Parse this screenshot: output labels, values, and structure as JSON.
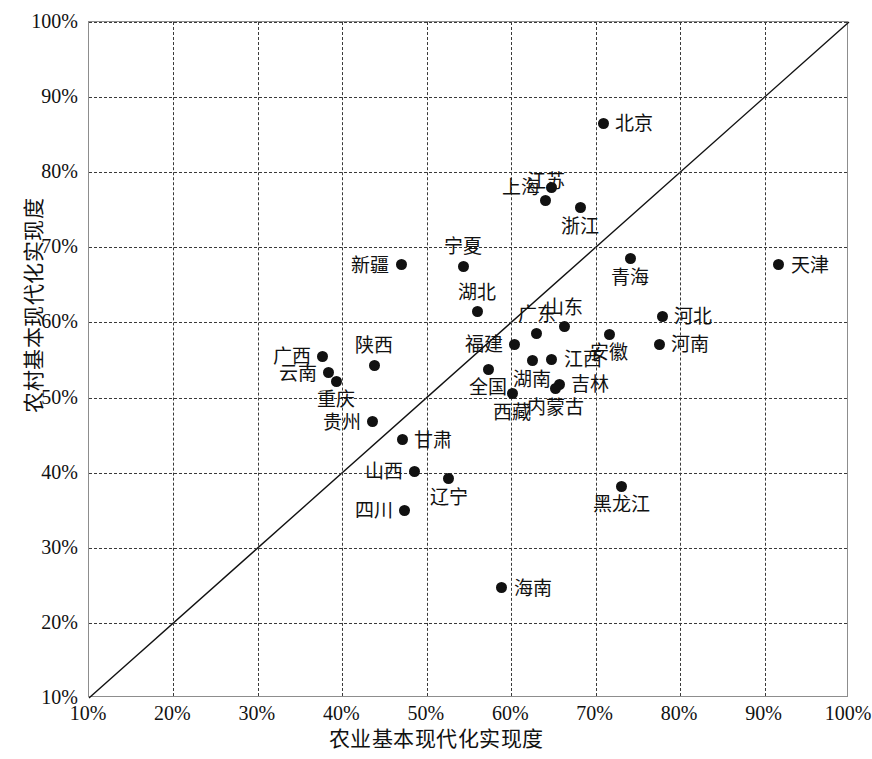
{
  "chart_data": {
    "type": "scatter",
    "title": "",
    "xlabel": "农业基本现代化实现度",
    "ylabel": "农村基本现代化实现度",
    "xlim": [
      10,
      100
    ],
    "ylim": [
      10,
      100
    ],
    "xticks": [
      "10%",
      "20%",
      "30%",
      "40%",
      "50%",
      "60%",
      "70%",
      "80%",
      "90%",
      "100%"
    ],
    "yticks": [
      "10%",
      "20%",
      "30%",
      "40%",
      "50%",
      "60%",
      "70%",
      "80%",
      "90%",
      "100%"
    ],
    "grid": true,
    "legend": "none",
    "reference_line": {
      "type": "identity",
      "from": [
        10,
        10
      ],
      "to": [
        100,
        100
      ]
    },
    "marker_color": "#111111",
    "grid_color": "#3a3a3a",
    "points": [
      {
        "label": "北京",
        "x": 70.9,
        "y": 86.5,
        "pos": "right"
      },
      {
        "label": "江苏",
        "x": 64.1,
        "y": 76.2,
        "pos": "above"
      },
      {
        "label": "上海",
        "x": 64.8,
        "y": 78.0,
        "pos": "left"
      },
      {
        "label": "浙江",
        "x": 68.2,
        "y": 75.3,
        "pos": "below"
      },
      {
        "label": "天津",
        "x": 91.7,
        "y": 67.7,
        "pos": "right"
      },
      {
        "label": "青海",
        "x": 74.1,
        "y": 68.5,
        "pos": "below"
      },
      {
        "label": "宁夏",
        "x": 54.3,
        "y": 67.5,
        "pos": "above"
      },
      {
        "label": "新疆",
        "x": 47.0,
        "y": 67.7,
        "pos": "left"
      },
      {
        "label": "湖北",
        "x": 56.0,
        "y": 61.4,
        "pos": "above"
      },
      {
        "label": "河北",
        "x": 77.9,
        "y": 60.8,
        "pos": "right"
      },
      {
        "label": "山东",
        "x": 66.3,
        "y": 59.4,
        "pos": "above"
      },
      {
        "label": "广东",
        "x": 63.0,
        "y": 58.5,
        "pos": "above"
      },
      {
        "label": "安徽",
        "x": 71.6,
        "y": 58.4,
        "pos": "below"
      },
      {
        "label": "河南",
        "x": 77.5,
        "y": 57.1,
        "pos": "right"
      },
      {
        "label": "福建",
        "x": 60.4,
        "y": 57.1,
        "pos": "left"
      },
      {
        "label": "广西",
        "x": 37.7,
        "y": 55.5,
        "pos": "left"
      },
      {
        "label": "陕西",
        "x": 43.8,
        "y": 54.3,
        "pos": "above"
      },
      {
        "label": "江西",
        "x": 64.8,
        "y": 55.1,
        "pos": "right"
      },
      {
        "label": "云南",
        "x": 38.4,
        "y": 53.3,
        "pos": "left"
      },
      {
        "label": "全国",
        "x": 57.3,
        "y": 53.8,
        "pos": "below"
      },
      {
        "label": "重庆",
        "x": 39.3,
        "y": 52.2,
        "pos": "below"
      },
      {
        "label": "湖南",
        "x": 62.5,
        "y": 54.9,
        "pos": "below"
      },
      {
        "label": "吉林",
        "x": 65.7,
        "y": 51.8,
        "pos": "right"
      },
      {
        "label": "内蒙古",
        "x": 65.2,
        "y": 51.2,
        "pos": "below"
      },
      {
        "label": "西藏",
        "x": 60.1,
        "y": 50.5,
        "pos": "below"
      },
      {
        "label": "贵州",
        "x": 43.6,
        "y": 46.8,
        "pos": "left"
      },
      {
        "label": "甘肃",
        "x": 47.1,
        "y": 44.4,
        "pos": "right"
      },
      {
        "label": "山西",
        "x": 48.6,
        "y": 40.2,
        "pos": "left"
      },
      {
        "label": "辽宁",
        "x": 52.6,
        "y": 39.2,
        "pos": "below"
      },
      {
        "label": "黑龙江",
        "x": 73.0,
        "y": 38.2,
        "pos": "below"
      },
      {
        "label": "四川",
        "x": 47.4,
        "y": 35.0,
        "pos": "left"
      },
      {
        "label": "海南",
        "x": 58.9,
        "y": 24.7,
        "pos": "right"
      }
    ]
  }
}
